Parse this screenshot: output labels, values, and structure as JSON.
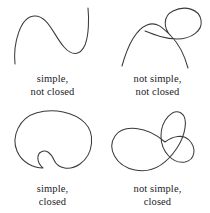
{
  "figure": {
    "stroke_color": "#3a3a3e",
    "background_color": "#ffffff",
    "text_color": "#1b1b1f",
    "panels": [
      {
        "id": "simple-not-closed",
        "curve_name": "open-s-curve",
        "caption_line1": "simple,",
        "caption_line2": "not closed",
        "simple": true,
        "closed": false,
        "self_intersections": 0,
        "path": "M 15 64 C 13 44, 20 17, 34 16 C 48 15, 54 36, 64 47 C 72 56, 80 56, 85 45 C 89 35, 89 18, 88 8"
      },
      {
        "id": "not-simple-not-closed",
        "curve_name": "looped-open-curve",
        "caption_line1": "not simple,",
        "caption_line2": "not closed",
        "simple": false,
        "closed": false,
        "self_intersections": 1,
        "path": "M 17 66 C 22 48, 30 30, 42 25 C 52 21, 58 28, 66 36 C 74 44, 80 57, 83 68 M 66 36 C 58 28, 58 16, 68 11 C 80 5, 94 9, 96 20 C 98 31, 86 39, 72 39 C 60 39, 50 35, 40 31"
      },
      {
        "id": "simple-closed",
        "curve_name": "bean-shaped-closed-curve",
        "caption_line1": "simple,",
        "caption_line2": "closed",
        "simple": true,
        "closed": true,
        "self_intersections": 0,
        "path": "M 43 62 C 34 62, 22 57, 17 45 C 11 31, 19 12, 36 7 C 54 2, 74 6, 85 17 C 95 27, 94 48, 80 58 C 70 65, 58 63, 54 54 C 51 47, 46 43, 41 46 C 37 48, 36 56, 43 62 Z"
      },
      {
        "id": "not-simple-closed",
        "curve_name": "figure-eight-closed-curve",
        "caption_line1": "not simple,",
        "caption_line2": "closed",
        "simple": false,
        "closed": true,
        "self_intersections": 1,
        "path": "M 60 36 C 42 20, 18 18, 10 30 C 2 42, 10 60, 30 64 C 50 68, 64 54, 72 42 C 80 30, 84 12, 76 7 C 68 2, 56 14, 56 30 C 56 46, 68 58, 80 56 C 90 54, 92 42, 84 34 C 78 28, 68 30, 60 36 Z"
      }
    ]
  }
}
